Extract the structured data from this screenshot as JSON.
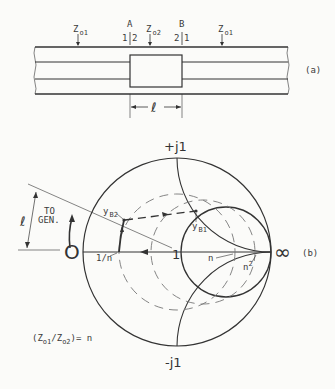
{
  "part_a": {
    "tag": "(a)",
    "labels": {
      "z1_left_main": "Z",
      "z1_left_sub": "o1",
      "z2_main": "Z",
      "z2_sub": "o2",
      "z1_right_main": "Z",
      "z1_right_sub": "o1",
      "ref_a": "A",
      "ref_b": "B",
      "a_left": "1",
      "a_right": "2",
      "b_left": "2",
      "b_right": "1",
      "length": "ℓ"
    }
  },
  "part_b": {
    "tag": "(b)",
    "labels": {
      "top": "+j1",
      "bottom": "-j1",
      "zero": "O",
      "infinity": "∞",
      "center": "1",
      "inv_n": "1/n",
      "n": "n",
      "n_sq_main": "n",
      "n_sq_sup": "2",
      "yb2_main": "y",
      "yb2_sub": "B2",
      "yb1_main": "y",
      "yb1_sub": "B1",
      "to_gen_1": "TO",
      "to_gen_2": "GEN.",
      "length": "ℓ"
    },
    "relation": {
      "open": "(Z",
      "sub1": "o1",
      "slash": "/Z",
      "sub2": "o2",
      "close": ")= n"
    }
  }
}
